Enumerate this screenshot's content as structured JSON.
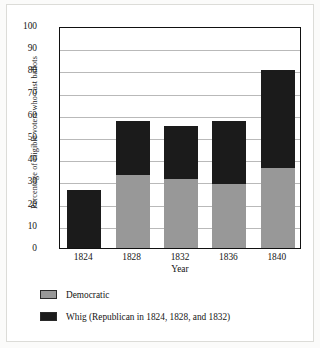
{
  "chart_data": {
    "type": "bar",
    "subtype": "stacked-vertical",
    "title": "",
    "xlabel": "Year",
    "ylabel": "Percentage of eligible voters who cast ballots",
    "categories": [
      "1824",
      "1828",
      "1832",
      "1836",
      "1840"
    ],
    "ylim": [
      0,
      100
    ],
    "yticks": [
      0,
      10,
      20,
      30,
      40,
      50,
      60,
      70,
      80,
      90,
      100
    ],
    "ytick_labels": [
      "0",
      "10",
      "20",
      "30",
      "40",
      "50",
      "60",
      "70",
      "80",
      "90",
      "100"
    ],
    "grid": true,
    "grid_axis": "y",
    "legend_position": "below-plot",
    "series": [
      {
        "name": "Democratic",
        "color": "#989898",
        "values": [
          0,
          33,
          31,
          29,
          36
        ]
      },
      {
        "name": "Whig (Republican in 1824, 1828, and 1832)",
        "color": "#1b1b1b",
        "values": [
          26,
          24,
          24,
          28,
          44
        ]
      }
    ],
    "totals": [
      26,
      57,
      55,
      57,
      80
    ]
  },
  "legend": {
    "items": [
      {
        "label": "Democratic",
        "color": "#989898",
        "swatch": "legend-swatch-democratic"
      },
      {
        "label": "Whig (Republican in 1824, 1828, and 1832)",
        "color": "#1b1b1b",
        "swatch": "legend-swatch-whig"
      }
    ]
  },
  "colors": {
    "democratic": "#989898",
    "whig": "#1b1b1b",
    "gridline": "#b9b9b9",
    "axis": "#111111",
    "background": "#ffffff"
  }
}
